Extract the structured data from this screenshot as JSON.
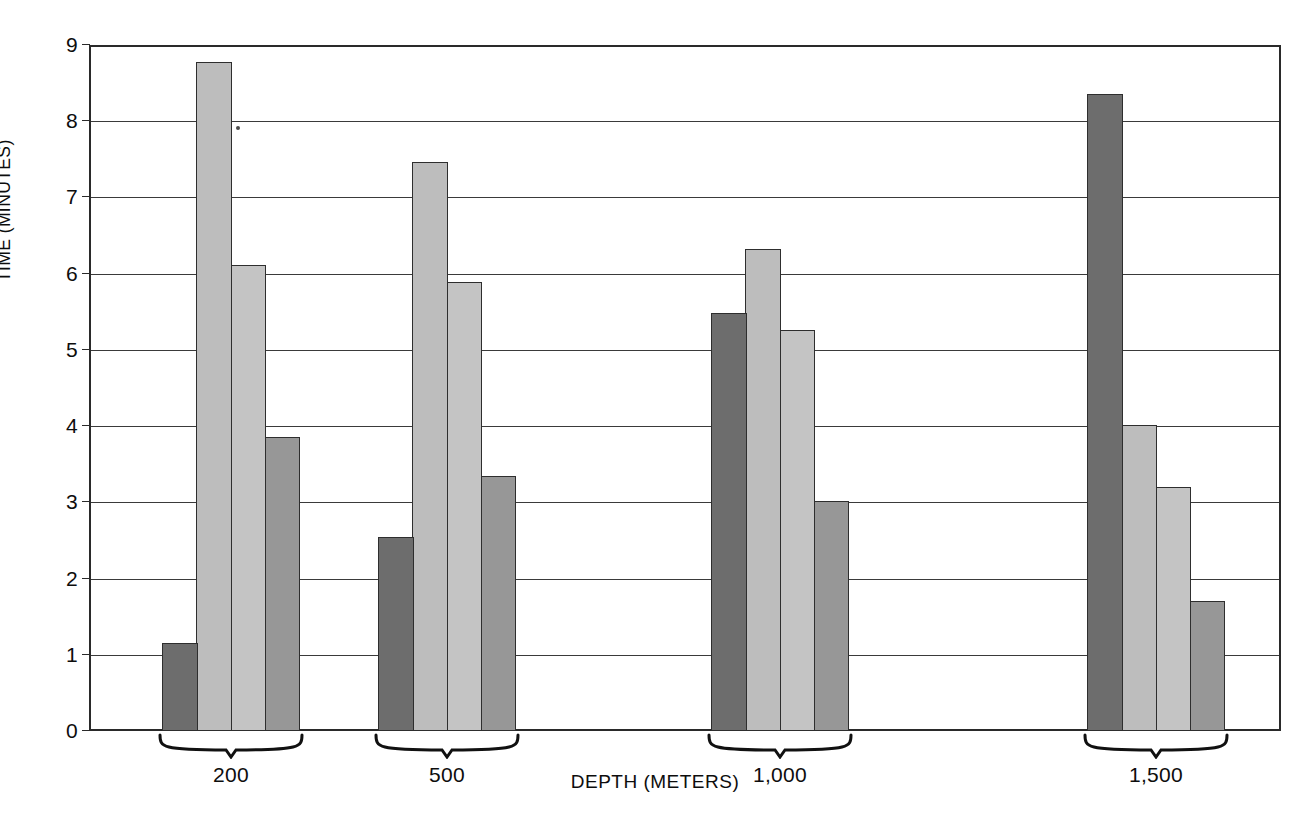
{
  "chart_data": {
    "type": "bar",
    "title": "",
    "subtitle": "",
    "xlabel": "DEPTH (METERS)",
    "ylabel": "TIME (MINUTES)",
    "categories": [
      "200",
      "500",
      "1,000",
      "1,500"
    ],
    "ylim": [
      0,
      9
    ],
    "yticks": [
      0,
      1,
      2,
      3,
      4,
      5,
      6,
      7,
      8,
      9
    ],
    "ytick_labels": [
      "0",
      "1",
      "2",
      "3",
      "4",
      "5",
      "6",
      "7",
      "8",
      "9"
    ],
    "grid": true,
    "legend": "none",
    "series": [
      {
        "name": "series-1",
        "color": "#6d6d6d",
        "values": [
          1.15,
          2.55,
          5.48,
          8.36
        ]
      },
      {
        "name": "series-2",
        "color": "#bdbdbd",
        "values": [
          8.78,
          7.46,
          6.32,
          4.01
        ]
      },
      {
        "name": "series-3",
        "color": "#c4c4c4",
        "values": [
          6.12,
          5.89,
          5.26,
          3.2
        ]
      },
      {
        "name": "series-4",
        "color": "#979797",
        "values": [
          3.86,
          3.35,
          3.02,
          1.7
        ]
      }
    ],
    "annotations": []
  },
  "axes": {
    "y_axis_title": "TIME (MINUTES)",
    "x_axis_title": "DEPTH (METERS)"
  },
  "colors": {
    "background": "#ffffff",
    "frame": "#2a2a2a",
    "gridline": "#3a3a3a",
    "text": "#0d0d0d"
  }
}
